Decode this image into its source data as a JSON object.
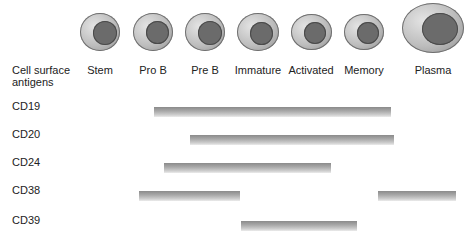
{
  "header": {
    "line1": "Cell surface",
    "line2": "antigens"
  },
  "stages": [
    {
      "label": "Stem",
      "cx": 100,
      "cy": 32,
      "w": 40,
      "h": 38,
      "nw": 24,
      "nh": 24,
      "nx": 13,
      "ny": 8
    },
    {
      "label": "Pro B",
      "cx": 153,
      "cy": 32,
      "w": 40,
      "h": 38,
      "nw": 23,
      "nh": 23,
      "nx": 13,
      "ny": 8
    },
    {
      "label": "Pre B",
      "cx": 205,
      "cy": 32,
      "w": 40,
      "h": 38,
      "nw": 24,
      "nh": 24,
      "nx": 13,
      "ny": 8
    },
    {
      "label": "Immature",
      "cx": 258,
      "cy": 32,
      "w": 42,
      "h": 38,
      "nw": 23,
      "nh": 23,
      "nx": 13,
      "ny": 9
    },
    {
      "label": "Activated",
      "cx": 311,
      "cy": 32,
      "w": 41,
      "h": 36,
      "nw": 22,
      "nh": 22,
      "nx": 13,
      "ny": 8
    },
    {
      "label": "Memory",
      "cx": 364,
      "cy": 32,
      "w": 40,
      "h": 36,
      "nw": 22,
      "nh": 22,
      "nx": 13,
      "ny": 8
    },
    {
      "label": "Plasma",
      "cx": 433,
      "cy": 28,
      "w": 62,
      "h": 50,
      "nw": 36,
      "nh": 32,
      "nx": 20,
      "ny": 10
    }
  ],
  "antigens": [
    {
      "label": "CD19",
      "y": 85,
      "bars": [
        {
          "x1": 154,
          "x2": 391
        }
      ]
    },
    {
      "label": "CD20",
      "y": 113,
      "bars": [
        {
          "x1": 190,
          "x2": 394
        }
      ]
    },
    {
      "label": "CD24",
      "y": 141,
      "bars": [
        {
          "x1": 164,
          "x2": 331
        }
      ]
    },
    {
      "label": "CD38",
      "y": 169,
      "bars": [
        {
          "x1": 139,
          "x2": 240
        },
        {
          "x1": 378,
          "x2": 456
        }
      ]
    },
    {
      "label": "CD39",
      "y": 199,
      "bars": [
        {
          "x1": 241,
          "x2": 357
        }
      ]
    }
  ],
  "colors": {
    "cell_body": "#bdbdbd",
    "nucleus": "#6b6b6b",
    "bar": "#a8a8a8"
  }
}
